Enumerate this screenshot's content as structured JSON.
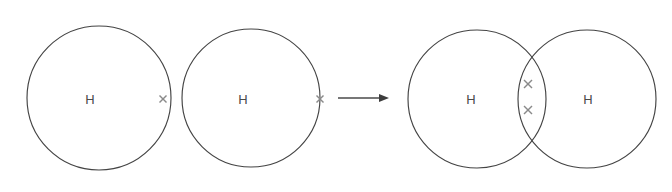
{
  "diagram": {
    "title": "Covalent bonding in a hydrogen molecule (dot-and-cross diagram)",
    "background_color": "#ffffff",
    "circle_stroke_color": "#444444",
    "cross_stroke_color": "#8a8a8a",
    "label_color": "#4a4a4a",
    "arrow_color": "#3d3d3d",
    "reactants": {
      "atoms": [
        {
          "element_symbol": "H",
          "label_x": 90,
          "label_y": 99,
          "circle": {
            "cx": 99,
            "cy": 98,
            "r": 72
          },
          "electrons": [
            {
              "type": "cross",
              "x": 163,
              "y": 99,
              "size": 7
            }
          ]
        },
        {
          "element_symbol": "H",
          "label_x": 243,
          "label_y": 99,
          "circle": {
            "cx": 251,
            "cy": 98,
            "r": 69
          },
          "electrons": [
            {
              "type": "cross",
              "x": 320,
              "y": 99,
              "size": 7
            }
          ]
        }
      ]
    },
    "arrow": {
      "name": "reaction-arrow",
      "x_start": 338,
      "x_end": 389,
      "y": 98,
      "head_length": 10,
      "head_half_height": 4
    },
    "product": {
      "formula": "H2",
      "atoms": [
        {
          "element_symbol": "H",
          "label_x": 471,
          "label_y": 99,
          "circle": {
            "cx": 477,
            "cy": 99,
            "r": 69
          }
        },
        {
          "element_symbol": "H",
          "label_x": 588,
          "label_y": 99,
          "circle": {
            "cx": 587,
            "cy": 99,
            "r": 69
          }
        }
      ],
      "shared_electrons": [
        {
          "type": "cross",
          "x": 528,
          "y": 84,
          "size": 8
        },
        {
          "type": "cross",
          "x": 528,
          "y": 110,
          "size": 8
        }
      ]
    }
  }
}
